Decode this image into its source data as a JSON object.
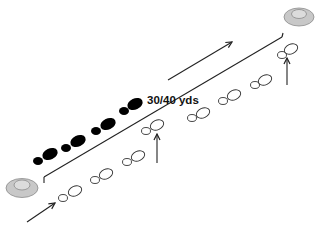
{
  "diagram": {
    "distance_label": "30/40 yds",
    "colors": {
      "line": "#222222",
      "solid_footprint": "#000000",
      "open_footprint_stroke": "#333333",
      "cone_fill": "#c8c8c8",
      "cone_stroke": "#8a8a8a",
      "cone_inner": "#dcdcdc"
    },
    "cones": [
      {
        "name": "start-cone",
        "cx": 22,
        "cy": 188
      },
      {
        "name": "end-cone",
        "cx": 299,
        "cy": 16
      }
    ],
    "solid_footprints": [
      {
        "small": [
          38,
          161
        ],
        "big": [
          50,
          154
        ]
      },
      {
        "small": [
          66,
          148
        ],
        "big": [
          78,
          141
        ]
      },
      {
        "small": [
          96,
          131
        ],
        "big": [
          108,
          124
        ]
      },
      {
        "small": [
          124,
          111
        ],
        "big": [
          135,
          104
        ]
      }
    ],
    "open_footprints": [
      {
        "small": [
          63,
          198
        ],
        "big": [
          75,
          191
        ]
      },
      {
        "small": [
          95,
          180
        ],
        "big": [
          106,
          174
        ]
      },
      {
        "small": [
          127,
          162
        ],
        "big": [
          138,
          156
        ]
      },
      {
        "small": [
          146,
          131
        ],
        "big": [
          157,
          125
        ]
      },
      {
        "small": [
          192,
          118
        ],
        "big": [
          203,
          113
        ]
      },
      {
        "small": [
          223,
          101
        ],
        "big": [
          234,
          95
        ]
      },
      {
        "small": [
          255,
          85
        ],
        "big": [
          265,
          80
        ]
      },
      {
        "small": [
          282,
          55
        ],
        "big": [
          291,
          49
        ]
      }
    ],
    "arrows": [
      {
        "name": "entry-arrow",
        "x1": 27,
        "y1": 222,
        "x2": 55,
        "y2": 203
      },
      {
        "name": "direction-arrow",
        "x1": 168,
        "y1": 80,
        "x2": 232,
        "y2": 42
      },
      {
        "name": "middle-turn-arrow",
        "x1": 157,
        "y1": 163,
        "x2": 157,
        "y2": 134
      },
      {
        "name": "end-turn-arrow",
        "x1": 287,
        "y1": 85,
        "x2": 287,
        "y2": 58
      }
    ],
    "bracket": {
      "x1": 44,
      "y1": 177,
      "x2": 282,
      "y2": 37
    }
  }
}
